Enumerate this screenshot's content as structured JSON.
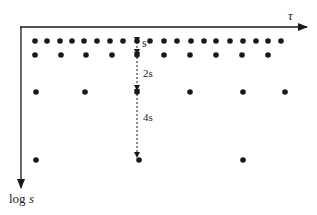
{
  "diagram": {
    "axes": {
      "x_label": "τ",
      "y_label_prefix": "log ",
      "y_label_var": "s"
    },
    "spacing_labels": {
      "first": "s",
      "second": "2s",
      "third": "4s"
    },
    "rows": [
      {
        "scale": "s",
        "y": 41,
        "x": [
          35,
          47,
          60,
          72,
          84,
          97,
          110,
          123,
          137,
          150,
          164,
          177,
          191,
          204,
          216,
          230,
          243,
          256,
          268,
          281
        ]
      },
      {
        "scale": "2s",
        "y": 55,
        "x": [
          35,
          61,
          86,
          112,
          137,
          164,
          190,
          216,
          242,
          268
        ]
      },
      {
        "scale": "4s",
        "y": 92,
        "x": [
          36,
          85,
          137,
          190,
          243,
          285
        ]
      },
      {
        "scale": "8s",
        "y": 160,
        "x": [
          36,
          139,
          243
        ]
      }
    ],
    "colors": {
      "ink": "#1a1a1a",
      "background": "#ffffff"
    }
  }
}
